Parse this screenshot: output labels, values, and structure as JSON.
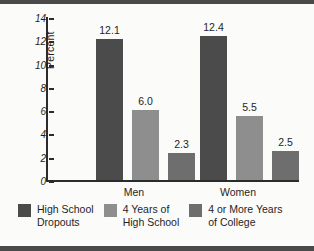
{
  "chart_data": {
    "type": "bar",
    "title": "",
    "xlabel": "",
    "ylabel": "Percent",
    "ylim": [
      0,
      14
    ],
    "ytick_step": 2,
    "yticks": [
      "0",
      "2",
      "4",
      "6",
      "8",
      "10",
      "12",
      "14"
    ],
    "grid": false,
    "legend_position": "bottom",
    "categories": [
      "Men",
      "Women"
    ],
    "series": [
      {
        "name": "High School\nDropouts",
        "color": "#4b4b4b",
        "values": [
          12.1,
          12.4
        ],
        "labels": [
          "12.1",
          "12.4"
        ]
      },
      {
        "name": "4 Years of\nHigh School",
        "color": "#8e8e8e",
        "values": [
          6.0,
          5.5
        ],
        "labels": [
          "6.0",
          "5.5"
        ]
      },
      {
        "name": "4 or More Years\nof College",
        "color": "#6e6e6e",
        "values": [
          2.3,
          2.5
        ],
        "labels": [
          "2.3",
          "2.5"
        ]
      }
    ]
  },
  "colors": {
    "background": "#fbfbf9",
    "axis": "#2b2b2b",
    "text": "#1f1f1f",
    "edge_rule": "#4a4a4a"
  }
}
